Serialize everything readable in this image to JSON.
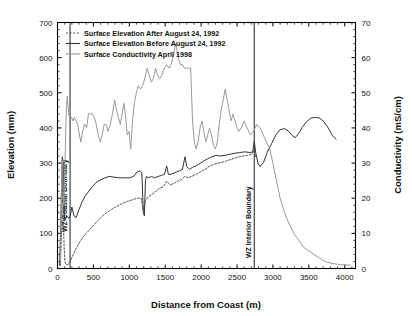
{
  "chart_data": {
    "type": "line",
    "title": "",
    "xlabel": "Distance from Coast (m)",
    "ylabel": "Elevation (mm)",
    "y2label": "Conductivity (mS/cm)",
    "xlim": [
      0,
      4150
    ],
    "ylim": [
      0,
      700
    ],
    "y2lim": [
      0,
      70
    ],
    "xticks": [
      0,
      500,
      1000,
      1500,
      2000,
      2500,
      3000,
      3500,
      4000
    ],
    "yticks": [
      0,
      100,
      200,
      300,
      400,
      500,
      600,
      700
    ],
    "y2ticks": [
      0,
      10,
      20,
      30,
      40,
      50,
      60,
      70
    ],
    "grid": false,
    "legend_position": "top-left",
    "legend": [
      "Surface Elevation After August 24, 1992",
      "Surface Elevation Before August 24, 1992",
      "Surface Conductivity April 1998"
    ],
    "annotations": [
      {
        "label": "WZ Coastal Boundary",
        "x": 175
      },
      {
        "label": "WZ Interior Boundary",
        "x": 2740
      }
    ],
    "series": [
      {
        "name": "Surface Elevation Before August 24, 1992",
        "axis": "left",
        "style": "solid",
        "color": "#333333",
        "points": [
          [
            30,
            10
          ],
          [
            45,
            120
          ],
          [
            55,
            215
          ],
          [
            62,
            300
          ],
          [
            68,
            318
          ],
          [
            75,
            300
          ],
          [
            82,
            255
          ],
          [
            90,
            180
          ],
          [
            100,
            135
          ],
          [
            112,
            140
          ],
          [
            125,
            150
          ],
          [
            140,
            148
          ],
          [
            160,
            143
          ],
          [
            180,
            152
          ],
          [
            200,
            175
          ],
          [
            230,
            150
          ],
          [
            260,
            145
          ],
          [
            300,
            168
          ],
          [
            340,
            188
          ],
          [
            380,
            205
          ],
          [
            430,
            218
          ],
          [
            480,
            232
          ],
          [
            540,
            245
          ],
          [
            600,
            252
          ],
          [
            660,
            258
          ],
          [
            720,
            262
          ],
          [
            790,
            260
          ],
          [
            860,
            258
          ],
          [
            930,
            258
          ],
          [
            1000,
            258
          ],
          [
            1060,
            262
          ],
          [
            1110,
            275
          ],
          [
            1150,
            278
          ],
          [
            1175,
            272
          ],
          [
            1195,
            160
          ],
          [
            1210,
            150
          ],
          [
            1225,
            250
          ],
          [
            1240,
            262
          ],
          [
            1270,
            258
          ],
          [
            1310,
            262
          ],
          [
            1350,
            258
          ],
          [
            1400,
            262
          ],
          [
            1450,
            265
          ],
          [
            1490,
            268
          ],
          [
            1520,
            292
          ],
          [
            1545,
            268
          ],
          [
            1580,
            268
          ],
          [
            1620,
            272
          ],
          [
            1660,
            275
          ],
          [
            1700,
            278
          ],
          [
            1740,
            282
          ],
          [
            1775,
            318
          ],
          [
            1800,
            290
          ],
          [
            1840,
            282
          ],
          [
            1880,
            288
          ],
          [
            1930,
            292
          ],
          [
            1980,
            298
          ],
          [
            2030,
            305
          ],
          [
            2090,
            312
          ],
          [
            2150,
            318
          ],
          [
            2210,
            322
          ],
          [
            2270,
            320
          ],
          [
            2330,
            322
          ],
          [
            2400,
            325
          ],
          [
            2470,
            328
          ],
          [
            2540,
            330
          ],
          [
            2610,
            332
          ],
          [
            2680,
            330
          ],
          [
            2720,
            332
          ],
          [
            2740,
            362
          ],
          [
            2760,
            330
          ],
          [
            2790,
            300
          ],
          [
            2820,
            290
          ],
          [
            2870,
            302
          ],
          [
            2920,
            330
          ],
          [
            2980,
            355
          ],
          [
            3040,
            380
          ],
          [
            3100,
            395
          ],
          [
            3160,
            398
          ],
          [
            3210,
            392
          ],
          [
            3260,
            380
          ],
          [
            3310,
            372
          ],
          [
            3360,
            385
          ],
          [
            3410,
            402
          ],
          [
            3470,
            418
          ],
          [
            3530,
            428
          ],
          [
            3590,
            430
          ],
          [
            3650,
            428
          ],
          [
            3710,
            418
          ],
          [
            3770,
            400
          ],
          [
            3830,
            378
          ],
          [
            3880,
            368
          ]
        ]
      },
      {
        "name": "Surface Elevation After August 24, 1992",
        "axis": "left",
        "style": "dashed",
        "color": "#444444",
        "points": [
          [
            40,
            8
          ],
          [
            60,
            120
          ],
          [
            68,
            300
          ],
          [
            72,
            260
          ],
          [
            80,
            150
          ],
          [
            92,
            60
          ],
          [
            105,
            18
          ],
          [
            125,
            10
          ],
          [
            150,
            12
          ],
          [
            180,
            22
          ],
          [
            215,
            38
          ],
          [
            255,
            55
          ],
          [
            300,
            72
          ],
          [
            350,
            88
          ],
          [
            400,
            100
          ],
          [
            455,
            112
          ],
          [
            510,
            125
          ],
          [
            570,
            138
          ],
          [
            630,
            150
          ],
          [
            690,
            160
          ],
          [
            750,
            168
          ],
          [
            810,
            175
          ],
          [
            870,
            182
          ],
          [
            930,
            188
          ],
          [
            990,
            192
          ],
          [
            1050,
            196
          ],
          [
            1110,
            200
          ],
          [
            1165,
            200
          ],
          [
            1195,
            165
          ],
          [
            1225,
            195
          ],
          [
            1270,
            205
          ],
          [
            1320,
            212
          ],
          [
            1370,
            220
          ],
          [
            1420,
            228
          ],
          [
            1470,
            232
          ],
          [
            1520,
            248
          ],
          [
            1570,
            238
          ],
          [
            1620,
            242
          ],
          [
            1670,
            248
          ],
          [
            1720,
            252
          ],
          [
            1775,
            262
          ],
          [
            1820,
            258
          ],
          [
            1870,
            262
          ],
          [
            1930,
            268
          ],
          [
            1990,
            275
          ],
          [
            2050,
            282
          ],
          [
            2110,
            290
          ],
          [
            2170,
            296
          ],
          [
            2230,
            300
          ],
          [
            2290,
            302
          ],
          [
            2350,
            306
          ],
          [
            2410,
            310
          ],
          [
            2470,
            314
          ],
          [
            2530,
            318
          ],
          [
            2590,
            320
          ],
          [
            2650,
            322
          ],
          [
            2710,
            326
          ],
          [
            2740,
            340
          ],
          [
            2760,
            318
          ]
        ]
      },
      {
        "name": "Surface Conductivity April 1998",
        "axis": "right",
        "style": "solid",
        "color": "#9a9a9a",
        "points": [
          [
            40,
            2
          ],
          [
            52,
            16
          ],
          [
            60,
            30
          ],
          [
            66,
            31
          ],
          [
            72,
            28
          ],
          [
            80,
            22
          ],
          [
            88,
            18
          ],
          [
            96,
            22
          ],
          [
            105,
            30
          ],
          [
            115,
            40
          ],
          [
            125,
            46
          ],
          [
            135,
            49
          ],
          [
            145,
            47
          ],
          [
            155,
            44
          ],
          [
            168,
            43
          ],
          [
            180,
            43
          ],
          [
            195,
            43
          ],
          [
            215,
            42
          ],
          [
            235,
            43
          ],
          [
            258,
            42
          ],
          [
            280,
            41
          ],
          [
            305,
            38
          ],
          [
            325,
            36
          ],
          [
            350,
            39
          ],
          [
            378,
            41
          ],
          [
            405,
            40
          ],
          [
            432,
            44
          ],
          [
            458,
            44
          ],
          [
            485,
            44
          ],
          [
            512,
            43
          ],
          [
            540,
            41
          ],
          [
            568,
            38
          ],
          [
            595,
            36
          ],
          [
            622,
            38
          ],
          [
            650,
            41
          ],
          [
            678,
            41
          ],
          [
            705,
            39
          ],
          [
            735,
            41
          ],
          [
            765,
            44
          ],
          [
            795,
            48
          ],
          [
            822,
            45
          ],
          [
            848,
            43
          ],
          [
            875,
            41
          ],
          [
            900,
            44
          ],
          [
            925,
            47
          ],
          [
            950,
            43
          ],
          [
            972,
            38
          ],
          [
            995,
            39
          ],
          [
            1020,
            34
          ],
          [
            1045,
            42
          ],
          [
            1070,
            47
          ],
          [
            1098,
            50
          ],
          [
            1125,
            52
          ],
          [
            1155,
            51
          ],
          [
            1185,
            52
          ],
          [
            1215,
            54
          ],
          [
            1248,
            57
          ],
          [
            1278,
            55
          ],
          [
            1305,
            53
          ],
          [
            1335,
            54
          ],
          [
            1365,
            57
          ],
          [
            1395,
            55
          ],
          [
            1425,
            54
          ],
          [
            1455,
            55
          ],
          [
            1488,
            57
          ],
          [
            1520,
            58
          ],
          [
            1552,
            57
          ],
          [
            1582,
            58
          ],
          [
            1615,
            61
          ],
          [
            1648,
            64
          ],
          [
            1680,
            60
          ],
          [
            1710,
            58
          ],
          [
            1740,
            58
          ],
          [
            1768,
            57
          ],
          [
            1798,
            57
          ],
          [
            1828,
            57
          ],
          [
            1855,
            57
          ],
          [
            1880,
            42
          ],
          [
            1905,
            36
          ],
          [
            1932,
            34
          ],
          [
            1958,
            36
          ],
          [
            1985,
            40
          ],
          [
            2012,
            42
          ],
          [
            2038,
            39
          ],
          [
            2065,
            36
          ],
          [
            2092,
            38
          ],
          [
            2118,
            40
          ],
          [
            2145,
            38
          ],
          [
            2172,
            35
          ],
          [
            2198,
            34
          ],
          [
            2225,
            36
          ],
          [
            2252,
            41
          ],
          [
            2280,
            45
          ],
          [
            2308,
            48
          ],
          [
            2335,
            51
          ],
          [
            2362,
            48
          ],
          [
            2390,
            45
          ],
          [
            2418,
            42
          ],
          [
            2445,
            44
          ],
          [
            2472,
            42
          ],
          [
            2500,
            40
          ],
          [
            2528,
            39
          ],
          [
            2560,
            40
          ],
          [
            2600,
            42
          ],
          [
            2640,
            40
          ],
          [
            2685,
            38
          ],
          [
            2730,
            39
          ],
          [
            2775,
            41
          ],
          [
            2820,
            40
          ],
          [
            2865,
            38
          ],
          [
            2910,
            36
          ],
          [
            2955,
            34
          ],
          [
            3000,
            30
          ],
          [
            3050,
            25
          ],
          [
            3100,
            20
          ],
          [
            3160,
            16
          ],
          [
            3220,
            13
          ],
          [
            3290,
            10
          ],
          [
            3360,
            8
          ],
          [
            3430,
            6
          ],
          [
            3500,
            5
          ],
          [
            3570,
            4
          ],
          [
            3650,
            3
          ],
          [
            3730,
            2
          ],
          [
            3810,
            1.5
          ],
          [
            3900,
            1.2
          ],
          [
            3990,
            1.0
          ],
          [
            4080,
            1.0
          ]
        ]
      }
    ]
  }
}
